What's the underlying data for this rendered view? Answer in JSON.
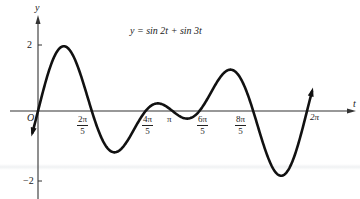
{
  "chart_data": {
    "type": "line",
    "title": "y = sin 2t + sin 3t",
    "xlabel": "t",
    "ylabel": "y",
    "origin_label": "O",
    "xlim": [
      0,
      6.2832
    ],
    "ylim": [
      -2,
      2
    ],
    "grid": false,
    "legend": null,
    "x_ticks": [
      {
        "label_num": "2π",
        "label_den": "5",
        "value": 1.2566
      },
      {
        "label_num": "4π",
        "label_den": "5",
        "value": 2.5133
      },
      {
        "label": "π",
        "value": 3.1416
      },
      {
        "label_num": "6π",
        "label_den": "5",
        "value": 3.7699
      },
      {
        "label_num": "8π",
        "label_den": "5",
        "value": 5.0265
      },
      {
        "label": "2π",
        "value": 6.2832
      }
    ],
    "y_ticks": [
      {
        "label": "2",
        "value": 2
      },
      {
        "label": "−2",
        "value": -2
      }
    ],
    "series": [
      {
        "name": "y = sin 2t + sin 3t",
        "t_range": [
          -0.13,
          6.4
        ],
        "x": [
          0,
          0.3142,
          0.6283,
          0.9425,
          1.2566,
          1.5708,
          1.885,
          2.1991,
          2.5133,
          2.8274,
          3.1416,
          3.4558,
          3.7699,
          4.0841,
          4.3982,
          4.7124,
          5.0265,
          5.3407,
          5.6549,
          5.969,
          6.2832
        ],
        "values": [
          0,
          1.3968,
          1.9021,
          1.1878,
          0,
          -0.8968,
          -1.1756,
          -0.5878,
          0,
          0.0878,
          0,
          -0.1122,
          0,
          0.5878,
          1.1756,
          1.0,
          0,
          -1.3968,
          -1.9021,
          -1.5878,
          0
        ]
      }
    ]
  },
  "labels": {
    "y_axis": "y",
    "t_axis": "t",
    "origin": "O",
    "equation": "y = sin 2t + sin 3t",
    "y_tick_pos": "2",
    "y_tick_neg": "−2",
    "tick_2pi5_num": "2π",
    "tick_2pi5_den": "5",
    "tick_4pi5_num": "4π",
    "tick_4pi5_den": "5",
    "tick_pi": "π",
    "tick_6pi5_num": "6π",
    "tick_6pi5_den": "5",
    "tick_8pi5_num": "8π",
    "tick_8pi5_den": "5",
    "tick_2pi": "2π"
  }
}
